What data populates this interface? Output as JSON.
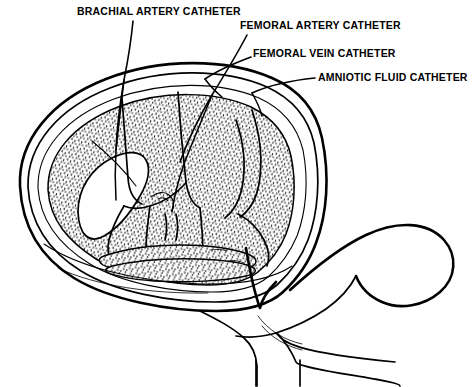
{
  "figure": {
    "kind": "line-art anatomical diagram",
    "background_color": "#ffffff",
    "ink_color": "#000000",
    "shading_style": "stipple"
  },
  "labels": [
    {
      "id": "brachial-artery-catheter",
      "text": "BRACHIAL ARTERY CATHETER",
      "text_x": 77,
      "text_y": 15,
      "leader": "M 133 21 C 131 42, 128 60, 124 80 C 120 103, 117 126, 116 150"
    },
    {
      "id": "femoral-artery-catheter",
      "text": "FEMORAL ARTERY CATHETER",
      "text_x": 240,
      "text_y": 29,
      "leader": "M 247 35 C 237 54, 225 74, 212 95 C 199 117, 188 140, 180 162"
    },
    {
      "id": "femoral-vein-catheter",
      "text": "FEMORAL VEIN CATHETER",
      "text_x": 253,
      "text_y": 57,
      "leader": "M 251 57 C 235 63, 218 70, 205 79"
    },
    {
      "id": "amniotic-fluid-catheter",
      "text": "AMNIOTIC FLUID CATHETER",
      "text_x": 318,
      "text_y": 81,
      "leader": "M 315 78 C 295 80, 272 84, 252 93"
    }
  ],
  "anatomy": {
    "uterus_label": "uterine wall",
    "fetus_label": "fetus",
    "horn_label": "uterine horn",
    "cervix_label": "cervix and vagina"
  }
}
